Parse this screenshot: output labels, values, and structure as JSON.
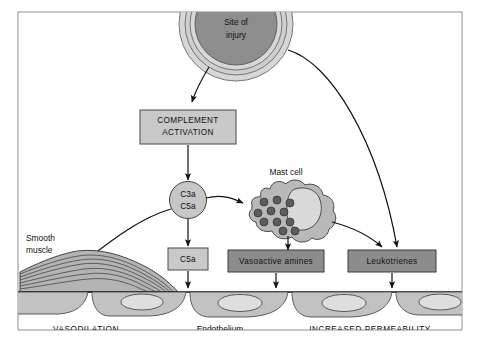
{
  "figure": {
    "title_alt": "Inflammation mediators pathway diagram",
    "nodes": {
      "injury": {
        "line1": "Site of",
        "line2": "injury"
      },
      "complement_box": {
        "line1": "COMPLEMENT",
        "line2": "ACTIVATION"
      },
      "c3a_c5a_circle": {
        "line1": "C3a",
        "line2": "C5a"
      },
      "c5a_box": {
        "label": "C5a"
      },
      "vasoactive_box": {
        "label": "Vasoactive amines"
      },
      "leukotrienes_box": {
        "label": "Leukotrienes"
      },
      "mast_cell": {
        "label": "Mast cell"
      },
      "smooth_muscle": {
        "line1": "Smooth",
        "line2": "muscle"
      }
    },
    "captions": {
      "left": "VASODILATION",
      "center": "Endothelium",
      "right": "INCREASED PERMEABILITY"
    },
    "colors": {
      "box_light": "#c9c9c9",
      "box_dark": "#8c8c8c",
      "injury_core": "#8e8e8e",
      "granule": "#5d5d5d",
      "endothelium": "#c2c2c2",
      "outline": "#111111",
      "frame": "#9a9a9a",
      "background": "#ffffff"
    },
    "counts": {
      "mast_cell_granules": 11,
      "endothelial_cells": 5
    }
  }
}
